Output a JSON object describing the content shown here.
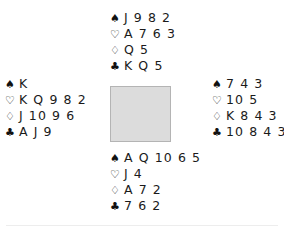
{
  "diagram": {
    "type": "bridge-deal",
    "suit_symbols": {
      "spade": "♠",
      "heart": "♡",
      "diamond": "♢",
      "club": "♣"
    },
    "colors": {
      "background": "#ffffff",
      "text": "#1a1a1a",
      "table_fill": "#dcdcdc",
      "table_border": "#b4b4b4",
      "footer_rule": "#ededed"
    }
  },
  "hands": {
    "north": {
      "position": "north",
      "spades": "J 9 8 2",
      "hearts": "A 7 6 3",
      "diamonds": "Q 5",
      "clubs": "K Q 5"
    },
    "west": {
      "position": "west",
      "spades": "K",
      "hearts": "K Q 9 8 2",
      "diamonds": "J 10 9 6",
      "clubs": "A J 9"
    },
    "east": {
      "position": "east",
      "spades": "7 4 3",
      "hearts": "10 5",
      "diamonds": "K 8 4 3",
      "clubs": "10 8 4 3"
    },
    "south": {
      "position": "south",
      "spades": "A Q 10 6 5",
      "hearts": "J 4",
      "diamonds": "A 7 2",
      "clubs": "7 6 2"
    }
  }
}
